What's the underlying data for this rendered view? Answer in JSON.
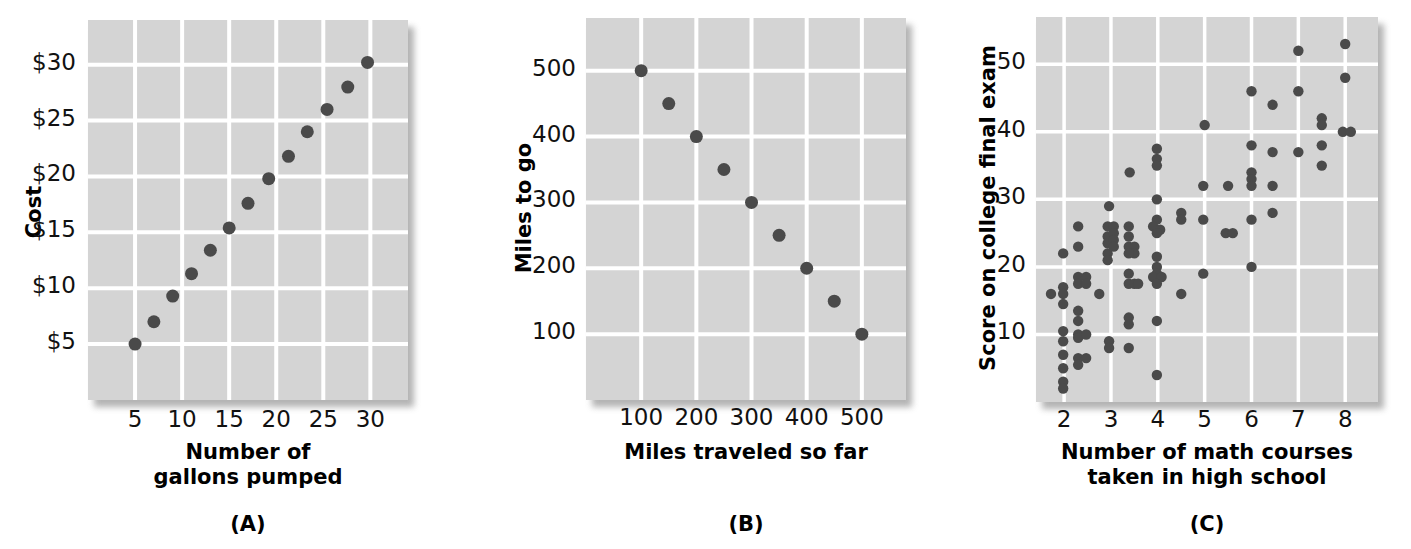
{
  "figure": {
    "background": "#ffffff",
    "plot_background": "#d4d4d4",
    "gridline_color": "#ffffff",
    "point_color": "#4a4a4a",
    "shadow_color": "#9a9a9a"
  },
  "panels": [
    {
      "tag": "(A)",
      "ylabel": "Cost",
      "xlabel": "Number of\ngallons pumped",
      "yticks": [
        "$5",
        "$10",
        "$15",
        "$20",
        "$25",
        "$30"
      ],
      "xticks": [
        "5",
        "10",
        "15",
        "20",
        "25",
        "30"
      ]
    },
    {
      "tag": "(B)",
      "ylabel": "Miles to go",
      "xlabel": "Miles traveled so far",
      "yticks": [
        "100",
        "200",
        "300",
        "400",
        "500"
      ],
      "xticks": [
        "100",
        "200",
        "300",
        "400",
        "500"
      ]
    },
    {
      "tag": "(C)",
      "ylabel": "Score on college final exam",
      "xlabel": "Number of math courses\ntaken in high school",
      "yticks": [
        "10",
        "20",
        "30",
        "40",
        "50"
      ],
      "xticks": [
        "2",
        "3",
        "4",
        "5",
        "6",
        "7",
        "8"
      ]
    }
  ],
  "chart_data": [
    {
      "type": "scatter",
      "panel": "(A)",
      "title": "",
      "xlabel": "Number of gallons pumped",
      "ylabel": "Cost",
      "xlim": [
        0,
        34
      ],
      "ylim": [
        0,
        34
      ],
      "xticks": [
        5,
        10,
        15,
        20,
        25,
        30
      ],
      "yticks": [
        5,
        10,
        15,
        20,
        25,
        30
      ],
      "xticklabels": [
        "5",
        "10",
        "15",
        "20",
        "25",
        "30"
      ],
      "yticklabels": [
        "$5",
        "$10",
        "$15",
        "$20",
        "$25",
        "$30"
      ],
      "grid": true,
      "legend": false,
      "relationship": "perfect positive linear",
      "points": [
        {
          "x": 5,
          "y": 5
        },
        {
          "x": 7,
          "y": 7
        },
        {
          "x": 9,
          "y": 9.3
        },
        {
          "x": 11,
          "y": 11.3
        },
        {
          "x": 13,
          "y": 13.4
        },
        {
          "x": 15,
          "y": 15.4
        },
        {
          "x": 17,
          "y": 17.6
        },
        {
          "x": 19.2,
          "y": 19.8
        },
        {
          "x": 21.3,
          "y": 21.8
        },
        {
          "x": 23.3,
          "y": 24
        },
        {
          "x": 25.4,
          "y": 26
        },
        {
          "x": 27.6,
          "y": 28
        },
        {
          "x": 29.7,
          "y": 30.2
        }
      ]
    },
    {
      "type": "scatter",
      "panel": "(B)",
      "title": "",
      "xlabel": "Miles traveled so far",
      "ylabel": "Miles to go",
      "xlim": [
        0,
        580
      ],
      "ylim": [
        0,
        580
      ],
      "xticks": [
        100,
        200,
        300,
        400,
        500
      ],
      "yticks": [
        100,
        200,
        300,
        400,
        500
      ],
      "xticklabels": [
        "100",
        "200",
        "300",
        "400",
        "500"
      ],
      "yticklabels": [
        "100",
        "200",
        "300",
        "400",
        "500"
      ],
      "grid": true,
      "legend": false,
      "relationship": "perfect negative linear",
      "points": [
        {
          "x": 100,
          "y": 500
        },
        {
          "x": 150,
          "y": 450
        },
        {
          "x": 200,
          "y": 400
        },
        {
          "x": 250,
          "y": 350
        },
        {
          "x": 300,
          "y": 300
        },
        {
          "x": 350,
          "y": 250
        },
        {
          "x": 400,
          "y": 200
        },
        {
          "x": 450,
          "y": 150
        },
        {
          "x": 500,
          "y": 100
        }
      ]
    },
    {
      "type": "scatter",
      "panel": "(C)",
      "title": "",
      "xlabel": "Number of math courses taken in high school",
      "ylabel": "Score on college final exam",
      "xlim": [
        1.4,
        8.7
      ],
      "ylim": [
        0,
        57
      ],
      "xticks": [
        2,
        3,
        4,
        5,
        6,
        7,
        8
      ],
      "yticks": [
        10,
        20,
        30,
        40,
        50
      ],
      "xticklabels": [
        "2",
        "3",
        "4",
        "5",
        "6",
        "7",
        "8"
      ],
      "yticklabels": [
        "10",
        "20",
        "30",
        "40",
        "50"
      ],
      "grid": true,
      "legend": false,
      "relationship": "moderate positive, scattered",
      "points": [
        {
          "x": 1.72,
          "y": 16
        },
        {
          "x": 1.98,
          "y": 22
        },
        {
          "x": 1.98,
          "y": 17
        },
        {
          "x": 1.98,
          "y": 16
        },
        {
          "x": 1.98,
          "y": 14.5
        },
        {
          "x": 1.98,
          "y": 10.5
        },
        {
          "x": 1.98,
          "y": 9
        },
        {
          "x": 1.98,
          "y": 7
        },
        {
          "x": 1.98,
          "y": 5
        },
        {
          "x": 1.98,
          "y": 3
        },
        {
          "x": 1.98,
          "y": 2
        },
        {
          "x": 2.3,
          "y": 26
        },
        {
          "x": 2.3,
          "y": 23
        },
        {
          "x": 2.3,
          "y": 18.5
        },
        {
          "x": 2.3,
          "y": 17.5
        },
        {
          "x": 2.3,
          "y": 13.5
        },
        {
          "x": 2.3,
          "y": 12
        },
        {
          "x": 2.3,
          "y": 10
        },
        {
          "x": 2.3,
          "y": 9.5
        },
        {
          "x": 2.3,
          "y": 6.5
        },
        {
          "x": 2.3,
          "y": 5.5
        },
        {
          "x": 2.47,
          "y": 18.5
        },
        {
          "x": 2.47,
          "y": 17.5
        },
        {
          "x": 2.47,
          "y": 10
        },
        {
          "x": 2.47,
          "y": 6.5
        },
        {
          "x": 2.75,
          "y": 16
        },
        {
          "x": 2.96,
          "y": 29
        },
        {
          "x": 2.93,
          "y": 26
        },
        {
          "x": 2.93,
          "y": 24.5
        },
        {
          "x": 2.93,
          "y": 23.5
        },
        {
          "x": 2.93,
          "y": 22
        },
        {
          "x": 2.93,
          "y": 21
        },
        {
          "x": 3.06,
          "y": 26
        },
        {
          "x": 3.06,
          "y": 25
        },
        {
          "x": 3.06,
          "y": 24
        },
        {
          "x": 3.06,
          "y": 23
        },
        {
          "x": 2.96,
          "y": 9
        },
        {
          "x": 2.96,
          "y": 8
        },
        {
          "x": 3.4,
          "y": 34
        },
        {
          "x": 3.38,
          "y": 26
        },
        {
          "x": 3.38,
          "y": 24.5
        },
        {
          "x": 3.38,
          "y": 23
        },
        {
          "x": 3.5,
          "y": 23
        },
        {
          "x": 3.5,
          "y": 22
        },
        {
          "x": 3.38,
          "y": 22
        },
        {
          "x": 3.38,
          "y": 19
        },
        {
          "x": 3.38,
          "y": 17.5
        },
        {
          "x": 3.5,
          "y": 17.5
        },
        {
          "x": 3.58,
          "y": 17.5
        },
        {
          "x": 3.38,
          "y": 12.5
        },
        {
          "x": 3.38,
          "y": 11.5
        },
        {
          "x": 3.38,
          "y": 8
        },
        {
          "x": 3.98,
          "y": 37.5
        },
        {
          "x": 3.98,
          "y": 36
        },
        {
          "x": 3.98,
          "y": 35
        },
        {
          "x": 3.98,
          "y": 30
        },
        {
          "x": 3.98,
          "y": 27
        },
        {
          "x": 3.9,
          "y": 26
        },
        {
          "x": 4.05,
          "y": 25.5
        },
        {
          "x": 3.98,
          "y": 25
        },
        {
          "x": 3.98,
          "y": 21.5
        },
        {
          "x": 3.98,
          "y": 20
        },
        {
          "x": 3.98,
          "y": 19
        },
        {
          "x": 3.9,
          "y": 18.5
        },
        {
          "x": 4.08,
          "y": 18.5
        },
        {
          "x": 3.98,
          "y": 17.5
        },
        {
          "x": 3.98,
          "y": 12
        },
        {
          "x": 3.98,
          "y": 4
        },
        {
          "x": 4.5,
          "y": 28
        },
        {
          "x": 4.5,
          "y": 27
        },
        {
          "x": 4.5,
          "y": 16
        },
        {
          "x": 5.0,
          "y": 41
        },
        {
          "x": 4.97,
          "y": 32
        },
        {
          "x": 4.97,
          "y": 27
        },
        {
          "x": 4.97,
          "y": 19
        },
        {
          "x": 5.5,
          "y": 32
        },
        {
          "x": 5.45,
          "y": 25
        },
        {
          "x": 5.6,
          "y": 25
        },
        {
          "x": 6.0,
          "y": 46
        },
        {
          "x": 6.0,
          "y": 38
        },
        {
          "x": 6.0,
          "y": 34
        },
        {
          "x": 6.0,
          "y": 33
        },
        {
          "x": 6.0,
          "y": 32
        },
        {
          "x": 6.0,
          "y": 27
        },
        {
          "x": 6.0,
          "y": 20
        },
        {
          "x": 6.45,
          "y": 44
        },
        {
          "x": 6.45,
          "y": 37
        },
        {
          "x": 6.45,
          "y": 32
        },
        {
          "x": 6.45,
          "y": 28
        },
        {
          "x": 7.0,
          "y": 52
        },
        {
          "x": 7.0,
          "y": 46
        },
        {
          "x": 7.0,
          "y": 37
        },
        {
          "x": 7.5,
          "y": 42
        },
        {
          "x": 7.5,
          "y": 41
        },
        {
          "x": 7.5,
          "y": 38
        },
        {
          "x": 7.5,
          "y": 35
        },
        {
          "x": 8.0,
          "y": 53
        },
        {
          "x": 8.0,
          "y": 48
        },
        {
          "x": 7.95,
          "y": 40
        },
        {
          "x": 8.12,
          "y": 40
        }
      ]
    }
  ]
}
